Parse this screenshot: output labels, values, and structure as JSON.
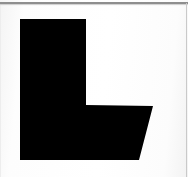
{
  "canvas": {
    "width": 188,
    "height": 177,
    "background_color": "#fdfdfd"
  },
  "rules": {
    "top_rule": {
      "label": "top-horizontal-rule",
      "color": "#8e8e8e",
      "x": 0,
      "y": 2,
      "width": 188,
      "height": 2
    },
    "right_rule": {
      "label": "right-vertical-rule",
      "color": "#c9c9c9",
      "x": 186,
      "y": 3,
      "width": 1,
      "height": 174
    },
    "left_edge": {
      "label": "left-edge-shading",
      "color": "#ededed",
      "x": 0,
      "y": 3,
      "width": 1,
      "height": 174
    }
  },
  "glyph": {
    "character": "L",
    "description": "block letter L with slanted outer edge on the foot",
    "fill_color": "#050505",
    "bounds": {
      "x": 20,
      "y": 19,
      "width": 133,
      "height": 141
    },
    "outline_points": "20,19 86,19 86,105 153,106 139,160 20,160",
    "vertices": [
      {
        "name": "stem-top-left",
        "x": 20,
        "y": 19
      },
      {
        "name": "stem-top-right",
        "x": 86,
        "y": 19
      },
      {
        "name": "inner-corner",
        "x": 86,
        "y": 105
      },
      {
        "name": "foot-top-right",
        "x": 153,
        "y": 106
      },
      {
        "name": "foot-bottom-right",
        "x": 139,
        "y": 160
      },
      {
        "name": "foot-bottom-left",
        "x": 20,
        "y": 160
      }
    ]
  }
}
